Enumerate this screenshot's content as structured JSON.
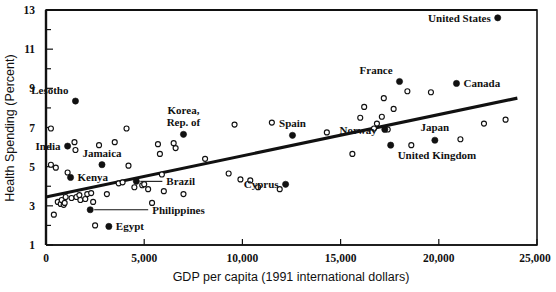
{
  "chart_data": {
    "type": "scatter",
    "title": "",
    "xlabel": "GDP per capita (1991 international dollars)",
    "ylabel": "Health Spending (Percent)",
    "xlim": [
      0,
      25000
    ],
    "ylim": [
      1,
      13
    ],
    "grid": false,
    "legend": "none",
    "x_ticks": [
      0,
      5000,
      10000,
      15000,
      20000,
      25000
    ],
    "x_tick_labels": [
      "0",
      "5,000",
      "10,000",
      "15,000",
      "20,000",
      "25,000"
    ],
    "y_ticks": [
      1,
      3,
      5,
      7,
      9,
      11,
      13
    ],
    "y_tick_labels": [
      "1",
      "3",
      "5",
      "7",
      "9",
      "11",
      "13"
    ],
    "y_minor_ticks": [
      2,
      4,
      6,
      8,
      10,
      12
    ],
    "trendline": {
      "x0": 0,
      "y0": 3.45,
      "x1": 24000,
      "y1": 8.5
    },
    "marker_styles": {
      "labeled": "filled-circle",
      "unlabeled": "open-circle"
    },
    "labeled_points": [
      {
        "name": "Lesotho",
        "x": 1500,
        "y": 8.35,
        "label_pos": "above-left"
      },
      {
        "name": "India",
        "x": 1100,
        "y": 6.05,
        "label_pos": "left"
      },
      {
        "name": "Kenya",
        "x": 1250,
        "y": 4.45,
        "label_pos": "right"
      },
      {
        "name": "Jamaica",
        "x": 2850,
        "y": 5.1,
        "label_pos": "above"
      },
      {
        "name": "Korea, Rep. of",
        "x": 7000,
        "y": 6.65,
        "label_pos": "above"
      },
      {
        "name": "Brazil",
        "x": 4600,
        "y": 4.25,
        "label_pos": "leader-right"
      },
      {
        "name": "Philippines",
        "x": 2250,
        "y": 2.8,
        "label_pos": "leader-right"
      },
      {
        "name": "Egypt",
        "x": 3200,
        "y": 1.95,
        "label_pos": "right"
      },
      {
        "name": "Cyprus",
        "x": 12200,
        "y": 4.1,
        "label_pos": "left"
      },
      {
        "name": "Spain",
        "x": 12550,
        "y": 6.6,
        "label_pos": "above"
      },
      {
        "name": "Norway",
        "x": 17250,
        "y": 6.9,
        "label_pos": "left"
      },
      {
        "name": "France",
        "x": 18000,
        "y": 9.35,
        "label_pos": "above-left"
      },
      {
        "name": "Canada",
        "x": 20900,
        "y": 9.25,
        "label_pos": "right"
      },
      {
        "name": "United Kingdom",
        "x": 17550,
        "y": 6.1,
        "label_pos": "right"
      },
      {
        "name": "Japan",
        "x": 19800,
        "y": 6.35,
        "label_pos": "above"
      },
      {
        "name": "United States",
        "x": 23000,
        "y": 12.6,
        "label_pos": "left"
      }
    ],
    "unlabeled_points": [
      {
        "x": 250,
        "y": 6.95
      },
      {
        "x": 250,
        "y": 5.1
      },
      {
        "x": 500,
        "y": 4.95
      },
      {
        "x": 400,
        "y": 2.55
      },
      {
        "x": 600,
        "y": 3.2
      },
      {
        "x": 750,
        "y": 3.1
      },
      {
        "x": 800,
        "y": 3.3
      },
      {
        "x": 900,
        "y": 3.05
      },
      {
        "x": 950,
        "y": 3.15
      },
      {
        "x": 1000,
        "y": 3.45
      },
      {
        "x": 1100,
        "y": 4.7
      },
      {
        "x": 1300,
        "y": 3.4
      },
      {
        "x": 1450,
        "y": 6.25
      },
      {
        "x": 1500,
        "y": 5.85
      },
      {
        "x": 1550,
        "y": 3.45
      },
      {
        "x": 1700,
        "y": 3.55
      },
      {
        "x": 1750,
        "y": 3.3
      },
      {
        "x": 2000,
        "y": 3.35
      },
      {
        "x": 2100,
        "y": 3.6
      },
      {
        "x": 2300,
        "y": 3.65
      },
      {
        "x": 2400,
        "y": 3.2
      },
      {
        "x": 2500,
        "y": 2.0
      },
      {
        "x": 2700,
        "y": 6.1
      },
      {
        "x": 3100,
        "y": 3.6
      },
      {
        "x": 3500,
        "y": 6.25
      },
      {
        "x": 3700,
        "y": 4.15
      },
      {
        "x": 3900,
        "y": 4.2
      },
      {
        "x": 4100,
        "y": 6.95
      },
      {
        "x": 4200,
        "y": 5.05
      },
      {
        "x": 4500,
        "y": 3.95
      },
      {
        "x": 4900,
        "y": 4.05
      },
      {
        "x": 5000,
        "y": 4.1
      },
      {
        "x": 5200,
        "y": 3.85
      },
      {
        "x": 5400,
        "y": 3.15
      },
      {
        "x": 5700,
        "y": 6.15
      },
      {
        "x": 5800,
        "y": 5.65
      },
      {
        "x": 5900,
        "y": 4.6
      },
      {
        "x": 6000,
        "y": 3.75
      },
      {
        "x": 6500,
        "y": 6.2
      },
      {
        "x": 6600,
        "y": 5.95
      },
      {
        "x": 7000,
        "y": 3.6
      },
      {
        "x": 8100,
        "y": 5.4
      },
      {
        "x": 9300,
        "y": 4.65
      },
      {
        "x": 9600,
        "y": 7.15
      },
      {
        "x": 9900,
        "y": 4.35
      },
      {
        "x": 10400,
        "y": 4.3
      },
      {
        "x": 10800,
        "y": 3.95
      },
      {
        "x": 11500,
        "y": 7.25
      },
      {
        "x": 11900,
        "y": 3.85
      },
      {
        "x": 14300,
        "y": 6.75
      },
      {
        "x": 15600,
        "y": 5.65
      },
      {
        "x": 16000,
        "y": 7.5
      },
      {
        "x": 16200,
        "y": 8.05
      },
      {
        "x": 16700,
        "y": 6.95
      },
      {
        "x": 16850,
        "y": 7.2
      },
      {
        "x": 17100,
        "y": 7.55
      },
      {
        "x": 17200,
        "y": 8.5
      },
      {
        "x": 17400,
        "y": 6.9
      },
      {
        "x": 17700,
        "y": 7.95
      },
      {
        "x": 18400,
        "y": 8.85
      },
      {
        "x": 18600,
        "y": 6.1
      },
      {
        "x": 19600,
        "y": 8.8
      },
      {
        "x": 21100,
        "y": 6.4
      },
      {
        "x": 22300,
        "y": 7.2
      },
      {
        "x": 23400,
        "y": 7.4
      }
    ]
  },
  "axis": {
    "x_title": "GDP per capita (1991 international dollars)",
    "y_title": "Health Spending (Percent)"
  }
}
